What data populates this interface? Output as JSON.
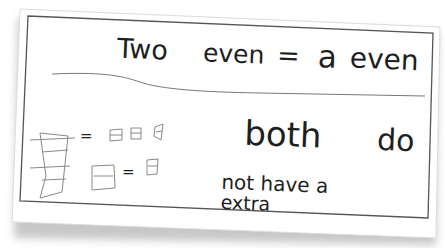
{
  "card": {
    "heading": {
      "word1": "Two",
      "word2": "even",
      "equals": "=",
      "word3": "a",
      "word4": "even"
    },
    "explanation": {
      "line1a": "both",
      "line1b": "do",
      "line2": "not have a",
      "line3": "extra"
    },
    "sketch": {
      "equals_top": "=",
      "equals_bottom": "="
    }
  },
  "colors": {
    "ink": "#1e1e1e",
    "pencil": "#8a8a8a",
    "card_border": "#555555",
    "card_fill": "#ffffff",
    "shadow": "#9a9a9a"
  }
}
